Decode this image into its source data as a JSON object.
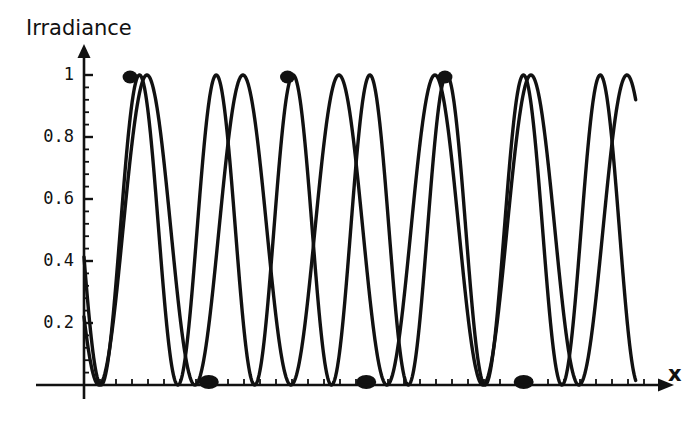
{
  "figure": {
    "background_color": "#ffffff",
    "curve_color": "#111111",
    "axis_color": "#111111"
  },
  "labels": {
    "y_axis_title": "Irradiance",
    "x_axis_title": "x"
  },
  "chart_data": {
    "type": "line",
    "title": "",
    "xlabel": "x",
    "ylabel": "Irradiance",
    "xlim": [
      0,
      9.0
    ],
    "ylim": [
      0,
      1.06
    ],
    "grid": false,
    "legend": null,
    "yticks": [
      0.2,
      0.4,
      0.6,
      0.8,
      1
    ],
    "ytick_labels": [
      "0.2",
      "0.4",
      "0.6",
      "0.8",
      "1"
    ],
    "xticks": [],
    "xtick_labels": [],
    "y_minor_tick_count": 4,
    "x_minor_tick_spacing": 0.25,
    "series": [
      {
        "name": "curve-a",
        "form": "sin^2",
        "amplitude": 1.0,
        "period": 1.5,
        "phase_deg": 152,
        "x_start": 0.0,
        "x_end": 8.62,
        "y_start": 0.55,
        "y_end": 0.94
      },
      {
        "name": "curve-b",
        "form": "sin^2",
        "amplitude": 1.0,
        "period": 1.2,
        "phase_deg": 140,
        "x_start": 0.0,
        "x_end": 8.62,
        "y_start": 0.6,
        "y_end": 0.48
      }
    ],
    "coincidence_points": [
      {
        "x": 0.72,
        "y": 1.0,
        "kind": "maximum"
      },
      {
        "x": 1.95,
        "y": 0.0,
        "kind": "minimum"
      },
      {
        "x": 3.18,
        "y": 1.0,
        "kind": "maximum"
      },
      {
        "x": 4.41,
        "y": 0.0,
        "kind": "minimum"
      },
      {
        "x": 5.64,
        "y": 1.0,
        "kind": "maximum"
      },
      {
        "x": 6.87,
        "y": 0.0,
        "kind": "minimum"
      }
    ]
  }
}
